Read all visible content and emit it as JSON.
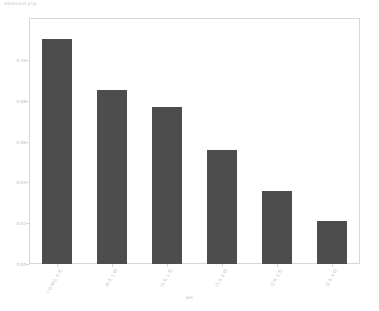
{
  "figure": {
    "title": "dasboard.png"
  },
  "axes": {
    "x_title": "bin",
    "y_title": ""
  },
  "chart_data": {
    "type": "bar",
    "title": "dasboard.png",
    "xlabel": "bin",
    "ylabel": "",
    "grid": false,
    "legend": "none",
    "bar_color": "#4d4d4d",
    "categories": [
      "(-0.001, 0.5]",
      "(0.5, 1.0]",
      "(1.0, 1.5]",
      "(1.5, 2.0]",
      "(2.0, 2.5]",
      "(2.5, 3.0]"
    ],
    "values": [
      0.11,
      0.085,
      0.077,
      0.056,
      0.036,
      0.021
    ],
    "ylim": [
      0.0,
      0.12
    ],
    "yticks": [
      0.0,
      0.02,
      0.04,
      0.06,
      0.08,
      0.1
    ],
    "ytick_labels": [
      "0.00",
      "0.02",
      "0.04",
      "0.06",
      "0.08",
      "0.10"
    ]
  }
}
